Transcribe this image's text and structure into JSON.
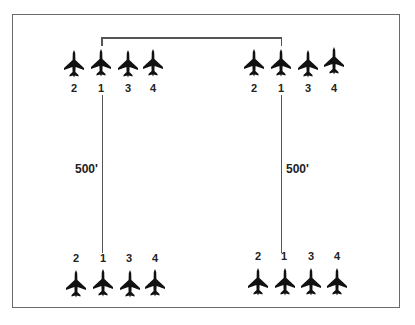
{
  "diagram": {
    "type": "formation-diagram",
    "ink_color": "#111111",
    "line_color": "#555555",
    "distance_label": "500'",
    "formations": [
      {
        "id": "top-left",
        "labels": [
          "2",
          "1",
          "3",
          "4"
        ]
      },
      {
        "id": "top-right",
        "labels": [
          "2",
          "1",
          "3",
          "4"
        ]
      },
      {
        "id": "bottom-left",
        "labels": [
          "2",
          "1",
          "3",
          "4"
        ]
      },
      {
        "id": "bottom-right",
        "labels": [
          "2",
          "1",
          "3",
          "4"
        ]
      }
    ],
    "connectors": {
      "left_distance": "500'",
      "right_distance": "500'"
    }
  }
}
